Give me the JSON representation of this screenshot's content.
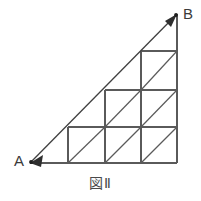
{
  "figure": {
    "caption": "図Ⅱ",
    "background_color": "#ffffff",
    "line_color": "#5a5a5a",
    "arrow_color": "#3f3f3f",
    "label_color": "#3a3a3a",
    "vertices": [
      {
        "name": "A",
        "label": "A",
        "x": 30,
        "y": 163
      },
      {
        "name": "B",
        "label": "B",
        "x": 177,
        "y": 14
      }
    ],
    "shape_type": "right-triangle-with-staircase-grid",
    "grid": {
      "cell_size": 36.5,
      "columns_x": [
        68,
        105,
        141,
        177
      ],
      "rows_y": [
        51,
        90,
        127,
        163
      ],
      "squares_per_row_top_to_bottom": [
        1,
        2,
        3
      ],
      "total_squares": 6,
      "total_diagonals": 6,
      "diagonal_direction": "bottom-left-to-top-right"
    },
    "segments": {
      "hypotenuse": {
        "from": "A",
        "to": "B",
        "arrowheads": "both"
      },
      "right_leg": {
        "x": 177,
        "y_from": 14,
        "y_to": 163
      },
      "bottom_leg": {
        "y": 163,
        "x_from": 30,
        "x_to": 177
      }
    }
  }
}
